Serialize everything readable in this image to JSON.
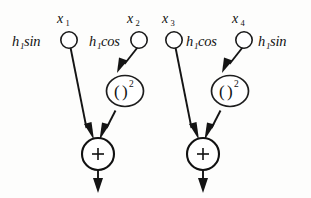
{
  "diagram": {
    "background_color": "#fdfdfc",
    "ink_color": "#141414",
    "inputs": [
      {
        "id": "x1",
        "node_label": "x",
        "node_subscript": "1",
        "weight_label": "h",
        "weight_subscript": "1",
        "weight_fn": "sin",
        "weight_side": "left"
      },
      {
        "id": "x2",
        "node_label": "x",
        "node_subscript": "2",
        "weight_label": "h",
        "weight_subscript": "1",
        "weight_fn": "cos",
        "weight_side": "left"
      },
      {
        "id": "x3",
        "node_label": "x",
        "node_subscript": "3",
        "weight_label": "h",
        "weight_subscript": "1",
        "weight_fn": "cos",
        "weight_side": "right"
      },
      {
        "id": "x4",
        "node_label": "x",
        "node_subscript": "4",
        "weight_label": "h",
        "weight_subscript": "1",
        "weight_fn": "sin",
        "weight_side": "right"
      }
    ],
    "square_nodes": [
      {
        "id": "sq-left",
        "open_paren": "(",
        "close_paren": ")",
        "exponent": "2"
      },
      {
        "id": "sq-right",
        "open_paren": "(",
        "close_paren": ")",
        "exponent": "2"
      }
    ],
    "sum_nodes": [
      {
        "id": "sum-left",
        "operator": "+"
      },
      {
        "id": "sum-right",
        "operator": "+"
      }
    ],
    "outputs": [
      {
        "id": "out-left"
      },
      {
        "id": "out-right"
      }
    ]
  }
}
